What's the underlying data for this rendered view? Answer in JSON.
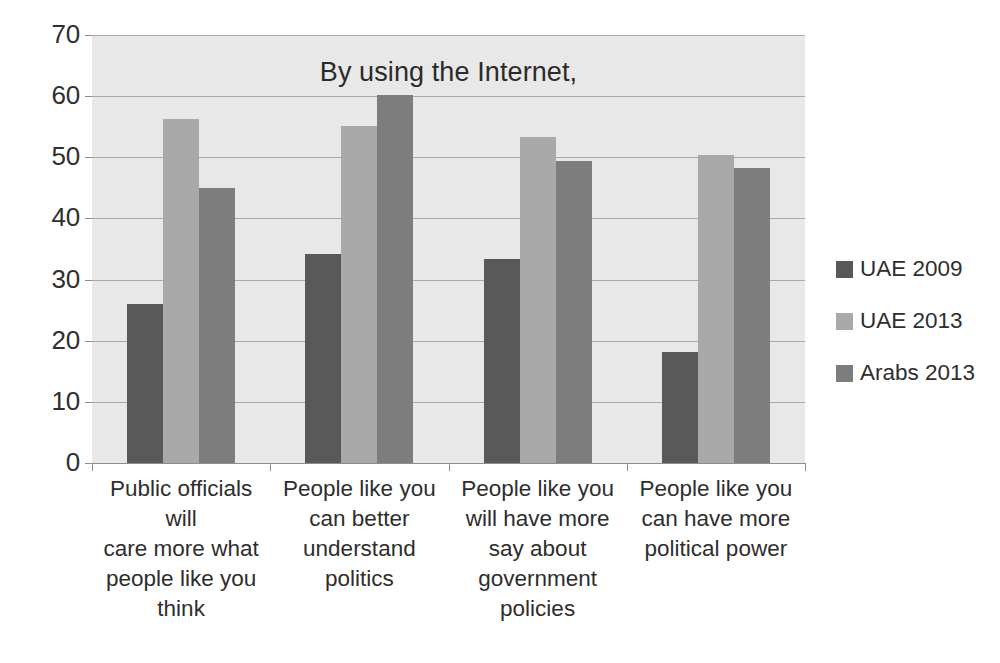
{
  "chart_data": {
    "type": "bar",
    "title": "By using the Internet,",
    "xlabel": "",
    "ylabel": "",
    "ylim": [
      0,
      70
    ],
    "ytick_step": 10,
    "yticks": [
      0,
      10,
      20,
      30,
      40,
      50,
      60,
      70
    ],
    "grid": true,
    "legend_position": "right",
    "categories": [
      "Public officials will care more what people like you think",
      "People like you can better understand politics",
      "People like you will have more say about government policies",
      "People like you can have more political power"
    ],
    "category_lines": [
      [
        "Public officials will",
        "care more what",
        "people like you",
        "think"
      ],
      [
        "People like you",
        "can better",
        "understand",
        "politics"
      ],
      [
        "People like you",
        "will have more",
        "say about",
        "government",
        "policies"
      ],
      [
        "People like you",
        "can have more",
        "political power"
      ]
    ],
    "series": [
      {
        "name": "UAE 2009",
        "color": "#595959",
        "values": [
          26,
          34.2,
          33.4,
          18.2
        ]
      },
      {
        "name": "UAE 2013",
        "color": "#a9a9a9",
        "values": [
          56.2,
          55.2,
          53.3,
          50.4
        ]
      },
      {
        "name": "Arabs 2013",
        "color": "#7d7d7d",
        "values": [
          45,
          60.2,
          49.4,
          48.3
        ]
      }
    ]
  },
  "colors": {
    "plot_background": "#e8e8e8",
    "gridline": "#a8a8a8",
    "axis": "#8d8d8d",
    "text": "#2b2b2b"
  }
}
